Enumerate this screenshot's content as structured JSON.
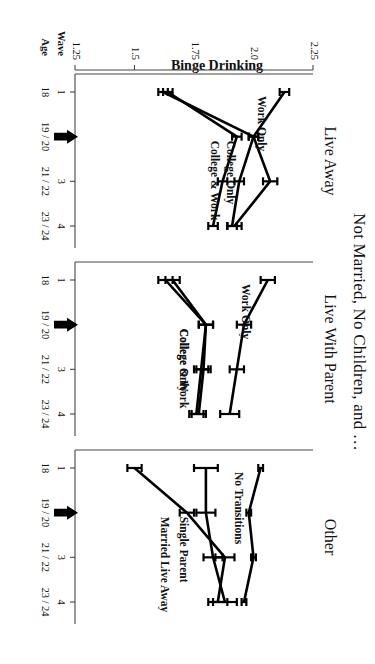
{
  "figure": {
    "title": "Not Married, No Children, and …",
    "y_axis_label": "Binge Drinking",
    "wave_row_label": "Wave",
    "age_row_label": "Age",
    "axis_color": "#444444",
    "line_color": "#000000",
    "marker_symbol": "arrow-left-annotation"
  },
  "chart_data": {
    "type": "line",
    "title": "Not Married, No Children, and …",
    "xlabel": "Wave / Age",
    "ylabel": "Binge Drinking",
    "ylim": [
      1.25,
      2.25
    ],
    "yticks": [
      "2.25",
      "2.0",
      "1.75",
      "1.5",
      "1.25"
    ],
    "ytick_values": [
      2.25,
      2.0,
      1.75,
      1.5,
      1.25
    ],
    "grid": false,
    "legend": "inline-series-labels",
    "x": [
      1,
      2,
      3,
      4
    ],
    "xtick_waves": [
      "1",
      "2",
      "3",
      "4"
    ],
    "xtick_ages": [
      "18",
      "19 / 20",
      "21 / 22",
      "23 / 24"
    ],
    "annotation": "Arrow at Wave 2 in each panel",
    "panels": [
      {
        "name": "Live Away",
        "series": [
          {
            "name": "Work Only",
            "values": [
              2.13,
              2.0,
              2.07,
              1.92
            ],
            "errors": [
              0.02,
              0.02,
              0.03,
              0.03
            ]
          },
          {
            "name": "College Only",
            "values": [
              1.62,
              2.0,
              1.94,
              1.91
            ],
            "errors": [
              0.02,
              0.02,
              0.02,
              0.02
            ]
          },
          {
            "name": "College & Work",
            "values": [
              1.64,
              1.93,
              1.87,
              1.83
            ],
            "errors": [
              0.02,
              0.02,
              0.02,
              0.02
            ]
          }
        ]
      },
      {
        "name": "Live With Parent",
        "series": [
          {
            "name": "Work Only",
            "values": [
              2.06,
              1.96,
              1.93,
              1.9
            ],
            "errors": [
              0.03,
              0.03,
              0.03,
              0.04
            ]
          },
          {
            "name": "College Only",
            "values": [
              1.66,
              1.8,
              1.79,
              1.77
            ],
            "errors": [
              0.03,
              0.03,
              0.03,
              0.03
            ]
          },
          {
            "name": "College & Work",
            "values": [
              1.63,
              1.8,
              1.78,
              1.76
            ],
            "errors": [
              0.03,
              0.03,
              0.03,
              0.03
            ]
          }
        ]
      },
      {
        "name": "Other",
        "series": [
          {
            "name": "No Transitions",
            "values": [
              2.03,
              1.98,
              2.0,
              1.96
            ],
            "errors": [
              0.01,
              0.01,
              0.01,
              0.01
            ]
          },
          {
            "name": "Single Parent",
            "values": [
              1.8,
              1.8,
              1.83,
              1.88
            ],
            "errors": [
              0.05,
              0.04,
              0.04,
              0.05
            ]
          },
          {
            "name": "Married Live Away",
            "values": [
              1.5,
              1.72,
              1.88,
              1.85
            ],
            "errors": [
              0.03,
              0.03,
              0.04,
              0.04
            ]
          }
        ]
      }
    ]
  }
}
